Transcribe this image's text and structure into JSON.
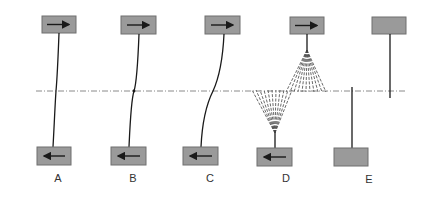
{
  "figure": {
    "colors": {
      "box_fill": "#9a9a9a",
      "box_stroke": "#6f6f6f",
      "line": "#1a1a1a",
      "axis": "#888888"
    },
    "panels": [
      {
        "label": "A",
        "top_arrow": "right-arrow",
        "bottom_arrow": "left-arrow",
        "shape": "slight curve"
      },
      {
        "label": "B",
        "top_arrow": "right-arrow",
        "bottom_arrow": "left-arrow",
        "shape": "kinked at axis"
      },
      {
        "label": "C",
        "top_arrow": "right-arrow",
        "bottom_arrow": "left-arrow",
        "shape": "S-curve"
      },
      {
        "label": "D",
        "top_arrow": "right-arrow",
        "bottom_arrow": "left-arrow",
        "shape": "fanned/fractured strands"
      },
      {
        "label": "E",
        "top_arrow": "",
        "bottom_arrow": "",
        "shape": "separated offset"
      }
    ]
  }
}
